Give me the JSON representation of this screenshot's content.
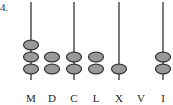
{
  "question_number": "4.",
  "abacus": {
    "columns": [
      {
        "label": "M",
        "has_rod": true,
        "beads": 3
      },
      {
        "label": "D",
        "has_rod": false,
        "beads": 2
      },
      {
        "label": "C",
        "has_rod": true,
        "beads": 2
      },
      {
        "label": "L",
        "has_rod": false,
        "beads": 2
      },
      {
        "label": "X",
        "has_rod": true,
        "beads": 1
      },
      {
        "label": "V",
        "has_rod": false,
        "beads": 0
      },
      {
        "label": "I",
        "has_rod": true,
        "beads": 2
      }
    ],
    "colors": {
      "rod": "#333333",
      "bead_fill": "#999999",
      "bead_stroke": "#333333"
    }
  }
}
